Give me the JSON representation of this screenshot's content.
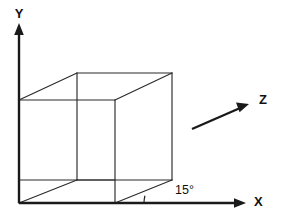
{
  "diagram": {
    "background_color": "#ffffff",
    "line_color": "#2b2b2b",
    "axis_color": "#1a1a1a",
    "labels": {
      "y_axis": "Y",
      "x_axis": "X",
      "z_axis": "Z",
      "angle": "15°"
    },
    "axes": {
      "origin": {
        "x": 19,
        "y": 203
      },
      "y_axis": {
        "x1": 19,
        "y1": 203,
        "x2": 19,
        "y2": 30,
        "tip_x": 19,
        "tip_y": 24
      },
      "x_axis": {
        "x1": 19,
        "y1": 203,
        "x2": 239,
        "y2": 203,
        "tip_x": 246,
        "tip_y": 203
      },
      "z_axis": {
        "x1": 192,
        "y1": 129,
        "x2": 242,
        "y2": 107,
        "tip_x": 249,
        "tip_y": 103
      }
    },
    "label_positions": {
      "y": {
        "x": 19,
        "y": 15
      },
      "x": {
        "x": 254,
        "y": 203
      },
      "z": {
        "x": 259,
        "y": 101
      },
      "angle": {
        "x": 175,
        "y": 191
      }
    },
    "angle_arc": {
      "value_degrees": 15,
      "vertex_x": 172,
      "vertex_y": 203,
      "radius": 28
    },
    "cube": {
      "description": "wireframe cube in oblique projection",
      "vertices": {
        "back_top_left": {
          "x": 19,
          "y": 100
        },
        "back_bottom_left": {
          "x": 19,
          "y": 180
        },
        "back_top_right": {
          "x": 115,
          "y": 100
        },
        "back_bottom_right": {
          "x": 115,
          "y": 180
        },
        "front_top_left": {
          "x": 77,
          "y": 73
        },
        "front_bottom_left": {
          "x": 77,
          "y": 180
        },
        "front_top_right": {
          "x": 172,
          "y": 73
        },
        "front_bottom_right": {
          "x": 172,
          "y": 180
        },
        "base_front_left": {
          "x": 19,
          "y": 203
        },
        "base_front_right": {
          "x": 115,
          "y": 203
        }
      }
    }
  }
}
